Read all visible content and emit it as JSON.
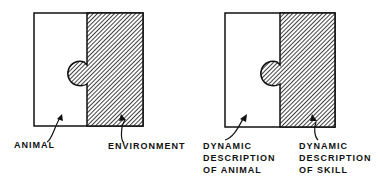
{
  "left_panel": {
    "label_left": "ANIMAL",
    "label_right": "ENVIRONMENT"
  },
  "right_panel": {
    "label_left": [
      "DYNAMIC",
      "DESCRIPTION",
      "OF ANIMAL"
    ],
    "label_right": [
      "DYNAMIC",
      "DESCRIPTION",
      "OF SKILL"
    ]
  },
  "colors": {
    "ink": "#111111",
    "background": "#ffffff"
  }
}
